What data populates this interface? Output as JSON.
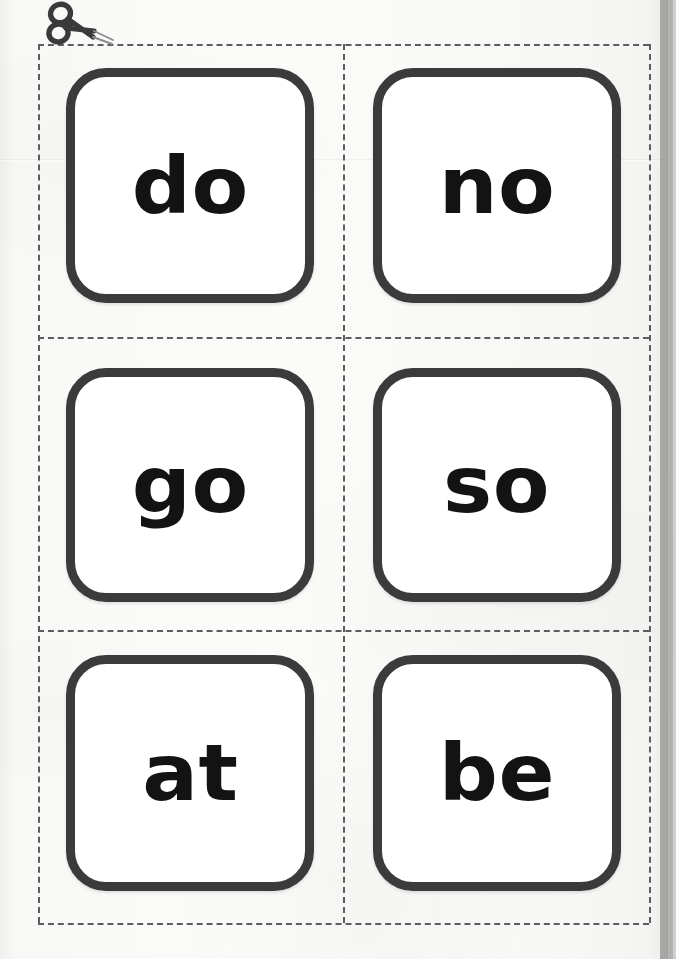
{
  "document": {
    "type": "printable-flashcard-sheet",
    "title": "Sight Word Flashcards",
    "background_color": "#f7f7f5",
    "card_border_color": "#3b3b3b",
    "card_fill_color": "#ffffff",
    "word_color": "#131313",
    "cut_line_color": "#5d5d5d"
  },
  "cut_guide": {
    "style": "dashed",
    "icon": "scissors-icon",
    "columns": 2,
    "rows": 3,
    "vertical_lines": [
      38,
      343,
      649
    ],
    "horizontal_lines": [
      44,
      337,
      630,
      923
    ]
  },
  "cards": [
    {
      "word": "do",
      "row": 1,
      "column": 1
    },
    {
      "word": "no",
      "row": 1,
      "column": 2
    },
    {
      "word": "go",
      "row": 2,
      "column": 1
    },
    {
      "word": "so",
      "row": 2,
      "column": 2
    },
    {
      "word": "at",
      "row": 3,
      "column": 1
    },
    {
      "word": "be",
      "row": 3,
      "column": 2
    }
  ]
}
